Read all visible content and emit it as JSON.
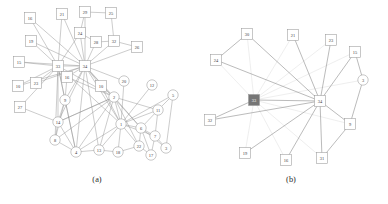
{
  "figure": {
    "background": "#ffffff",
    "node_stroke": "#9a9a9a",
    "node_fill": "#ffffff",
    "node_highlight_fill": "#767676",
    "edge_color": "#8d8d8d",
    "edge_color_faint": "#d8d8d8",
    "label_color": "#3a3a3a"
  },
  "panels": [
    {
      "id": "panel-a",
      "caption": "(a)",
      "caption_x": 97,
      "caption_y": 182,
      "nodes": [
        {
          "id": "16",
          "label": "16",
          "x": 30,
          "y": 18,
          "shape": "square"
        },
        {
          "id": "21",
          "label": "21",
          "x": 62,
          "y": 14,
          "shape": "square"
        },
        {
          "id": "29",
          "label": "29",
          "x": 85,
          "y": 12,
          "shape": "square"
        },
        {
          "id": "25",
          "label": "25",
          "x": 111,
          "y": 13,
          "shape": "square"
        },
        {
          "id": "24",
          "label": "24",
          "x": 80,
          "y": 33,
          "shape": "square"
        },
        {
          "id": "28",
          "label": "28",
          "x": 96,
          "y": 42,
          "shape": "square"
        },
        {
          "id": "32",
          "label": "32",
          "x": 114,
          "y": 41,
          "shape": "square"
        },
        {
          "id": "19",
          "label": "19",
          "x": 31,
          "y": 41,
          "shape": "square"
        },
        {
          "id": "26",
          "label": "26",
          "x": 137,
          "y": 47,
          "shape": "square"
        },
        {
          "id": "15",
          "label": "15",
          "x": 19,
          "y": 62,
          "shape": "square"
        },
        {
          "id": "33",
          "label": "33",
          "x": 58,
          "y": 66,
          "shape": "square"
        },
        {
          "id": "34",
          "label": "34",
          "x": 85,
          "y": 66,
          "shape": "square"
        },
        {
          "id": "10",
          "label": "10",
          "x": 18,
          "y": 86,
          "shape": "square"
        },
        {
          "id": "23",
          "label": "23",
          "x": 36,
          "y": 83,
          "shape": "square"
        },
        {
          "id": "16b",
          "label": "16",
          "x": 67,
          "y": 77,
          "shape": "square"
        },
        {
          "id": "10b",
          "label": "10",
          "x": 101,
          "y": 86,
          "shape": "square"
        },
        {
          "id": "20",
          "label": "20",
          "x": 124,
          "y": 81,
          "shape": "circle"
        },
        {
          "id": "12",
          "label": "12",
          "x": 152,
          "y": 85,
          "shape": "circle"
        },
        {
          "id": "5",
          "label": "5",
          "x": 173,
          "y": 95,
          "shape": "circle"
        },
        {
          "id": "9",
          "label": "9",
          "x": 65,
          "y": 100,
          "shape": "circle"
        },
        {
          "id": "2",
          "label": "2",
          "x": 114,
          "y": 97,
          "shape": "circle"
        },
        {
          "id": "11",
          "label": "11",
          "x": 158,
          "y": 110,
          "shape": "circle"
        },
        {
          "id": "27",
          "label": "27",
          "x": 20,
          "y": 107,
          "shape": "square"
        },
        {
          "id": "14",
          "label": "14",
          "x": 58,
          "y": 122,
          "shape": "circle"
        },
        {
          "id": "1",
          "label": "1",
          "x": 121,
          "y": 124,
          "shape": "circle"
        },
        {
          "id": "6",
          "label": "6",
          "x": 141,
          "y": 128,
          "shape": "circle"
        },
        {
          "id": "8",
          "label": "8",
          "x": 55,
          "y": 140,
          "shape": "circle"
        },
        {
          "id": "7",
          "label": "7",
          "x": 155,
          "y": 136,
          "shape": "circle"
        },
        {
          "id": "4",
          "label": "4",
          "x": 76,
          "y": 152,
          "shape": "circle"
        },
        {
          "id": "13",
          "label": "13",
          "x": 99,
          "y": 150,
          "shape": "circle"
        },
        {
          "id": "18",
          "label": "18",
          "x": 118,
          "y": 152,
          "shape": "circle"
        },
        {
          "id": "22",
          "label": "22",
          "x": 139,
          "y": 146,
          "shape": "circle"
        },
        {
          "id": "17",
          "label": "17",
          "x": 151,
          "y": 155,
          "shape": "circle"
        },
        {
          "id": "3",
          "label": "3",
          "x": 166,
          "y": 148,
          "shape": "circle"
        }
      ],
      "edges": [
        [
          "16",
          "33"
        ],
        [
          "16",
          "34"
        ],
        [
          "21",
          "33"
        ],
        [
          "21",
          "34"
        ],
        [
          "29",
          "24"
        ],
        [
          "29",
          "25"
        ],
        [
          "29",
          "34"
        ],
        [
          "25",
          "32"
        ],
        [
          "24",
          "33"
        ],
        [
          "24",
          "34"
        ],
        [
          "24",
          "28"
        ],
        [
          "28",
          "34"
        ],
        [
          "28",
          "32"
        ],
        [
          "32",
          "34"
        ],
        [
          "32",
          "26"
        ],
        [
          "26",
          "34"
        ],
        [
          "19",
          "33"
        ],
        [
          "19",
          "34"
        ],
        [
          "15",
          "33"
        ],
        [
          "15",
          "34"
        ],
        [
          "10",
          "33"
        ],
        [
          "10",
          "34"
        ],
        [
          "23",
          "33"
        ],
        [
          "23",
          "34"
        ],
        [
          "27",
          "33"
        ],
        [
          "27",
          "14"
        ],
        [
          "33",
          "34"
        ],
        [
          "33",
          "16b"
        ],
        [
          "33",
          "9"
        ],
        [
          "33",
          "14"
        ],
        [
          "33",
          "8"
        ],
        [
          "33",
          "4"
        ],
        [
          "33",
          "2"
        ],
        [
          "33",
          "1"
        ],
        [
          "34",
          "16b"
        ],
        [
          "34",
          "10b"
        ],
        [
          "34",
          "9"
        ],
        [
          "34",
          "2"
        ],
        [
          "34",
          "1"
        ],
        [
          "34",
          "20"
        ],
        [
          "34",
          "14"
        ],
        [
          "34",
          "4"
        ],
        [
          "34",
          "13"
        ],
        [
          "34",
          "6"
        ],
        [
          "16b",
          "9"
        ],
        [
          "16b",
          "2"
        ],
        [
          "10b",
          "2"
        ],
        [
          "10b",
          "1"
        ],
        [
          "20",
          "1"
        ],
        [
          "12",
          "1"
        ],
        [
          "2",
          "1"
        ],
        [
          "2",
          "14"
        ],
        [
          "2",
          "8"
        ],
        [
          "2",
          "4"
        ],
        [
          "2",
          "13"
        ],
        [
          "2",
          "6"
        ],
        [
          "2",
          "11"
        ],
        [
          "2",
          "22"
        ],
        [
          "9",
          "14"
        ],
        [
          "9",
          "8"
        ],
        [
          "9",
          "4"
        ],
        [
          "14",
          "8"
        ],
        [
          "14",
          "4"
        ],
        [
          "14",
          "2"
        ],
        [
          "8",
          "4"
        ],
        [
          "4",
          "13"
        ],
        [
          "1",
          "6"
        ],
        [
          "1",
          "11"
        ],
        [
          "1",
          "13"
        ],
        [
          "1",
          "18"
        ],
        [
          "1",
          "22"
        ],
        [
          "1",
          "7"
        ],
        [
          "1",
          "5"
        ],
        [
          "1",
          "4"
        ],
        [
          "6",
          "7"
        ],
        [
          "6",
          "11"
        ],
        [
          "6",
          "22"
        ],
        [
          "6",
          "17"
        ],
        [
          "6",
          "3"
        ],
        [
          "11",
          "5"
        ],
        [
          "11",
          "7"
        ],
        [
          "7",
          "17"
        ],
        [
          "7",
          "3"
        ],
        [
          "22",
          "17"
        ],
        [
          "5",
          "3"
        ],
        [
          "13",
          "18"
        ],
        [
          "18",
          "22"
        ]
      ]
    },
    {
      "id": "panel-b",
      "caption": "(b)",
      "caption_x": 291,
      "caption_y": 182,
      "nodes": [
        {
          "id": "30",
          "label": "30",
          "x": 247,
          "y": 34,
          "shape": "square"
        },
        {
          "id": "21",
          "label": "21",
          "x": 293,
          "y": 35,
          "shape": "square"
        },
        {
          "id": "23",
          "label": "23",
          "x": 331,
          "y": 40,
          "shape": "square"
        },
        {
          "id": "15",
          "label": "15",
          "x": 355,
          "y": 52,
          "shape": "square"
        },
        {
          "id": "24",
          "label": "24",
          "x": 216,
          "y": 60,
          "shape": "square"
        },
        {
          "id": "3",
          "label": "3",
          "x": 363,
          "y": 80,
          "shape": "circle"
        },
        {
          "id": "33",
          "label": "33",
          "x": 254,
          "y": 100,
          "shape": "square",
          "highlight": true
        },
        {
          "id": "34",
          "label": "34",
          "x": 320,
          "y": 101,
          "shape": "square"
        },
        {
          "id": "32",
          "label": "32",
          "x": 210,
          "y": 120,
          "shape": "square"
        },
        {
          "id": "9",
          "label": "9",
          "x": 350,
          "y": 124,
          "shape": "square"
        },
        {
          "id": "19",
          "label": "19",
          "x": 245,
          "y": 153,
          "shape": "square"
        },
        {
          "id": "16",
          "label": "16",
          "x": 286,
          "y": 160,
          "shape": "square"
        },
        {
          "id": "31",
          "label": "31",
          "x": 322,
          "y": 158,
          "shape": "square"
        }
      ],
      "edges_solid": [
        [
          "30",
          "24"
        ],
        [
          "30",
          "34"
        ],
        [
          "21",
          "34"
        ],
        [
          "23",
          "34"
        ],
        [
          "15",
          "34"
        ],
        [
          "24",
          "34"
        ],
        [
          "32",
          "34"
        ],
        [
          "19",
          "34"
        ],
        [
          "16",
          "34"
        ],
        [
          "31",
          "34"
        ],
        [
          "9",
          "34"
        ],
        [
          "9",
          "31"
        ],
        [
          "9",
          "3"
        ],
        [
          "3",
          "15"
        ],
        [
          "33",
          "32"
        ],
        [
          "33",
          "34"
        ]
      ],
      "edges_faint": [
        [
          "33",
          "30"
        ],
        [
          "33",
          "21"
        ],
        [
          "33",
          "23"
        ],
        [
          "33",
          "15"
        ],
        [
          "33",
          "24"
        ],
        [
          "33",
          "19"
        ],
        [
          "33",
          "16"
        ],
        [
          "33",
          "31"
        ],
        [
          "33",
          "9"
        ],
        [
          "33",
          "3"
        ]
      ]
    }
  ]
}
